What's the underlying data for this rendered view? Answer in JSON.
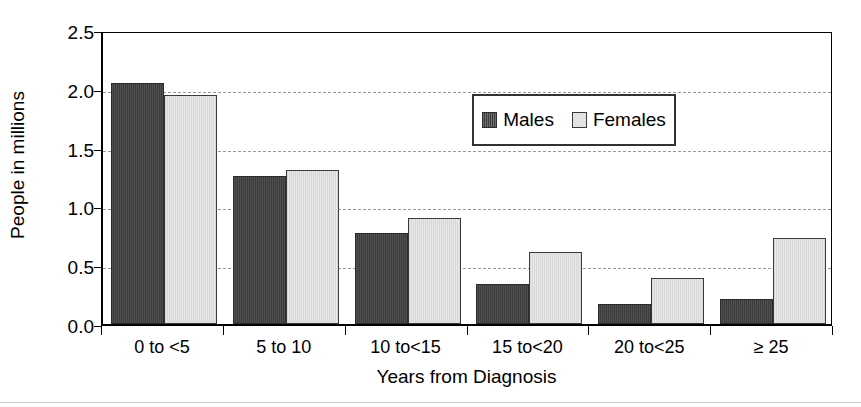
{
  "chart_data": {
    "type": "bar",
    "title": "",
    "xlabel": "Years from Diagnosis",
    "ylabel": "People in millions",
    "categories": [
      "0 to <5",
      "5 to 10",
      "10 to<15",
      "15 to<20",
      "20 to<25",
      "≥ 25"
    ],
    "series": [
      {
        "name": "Males",
        "values": [
          2.05,
          1.26,
          0.77,
          0.34,
          0.17,
          0.21
        ],
        "color": "#3c3c3c"
      },
      {
        "name": "Females",
        "values": [
          1.95,
          1.31,
          0.9,
          0.61,
          0.39,
          0.73
        ],
        "color": "#e8e8e8"
      }
    ],
    "ylim": [
      0.0,
      2.5
    ],
    "ytick_labels": [
      "0.0",
      "0.5",
      "1.0",
      "1.5",
      "2.0",
      "2.5"
    ],
    "ytick_values": [
      0.0,
      0.5,
      1.0,
      1.5,
      2.0,
      2.5
    ],
    "grid": true,
    "grid_axis": "y",
    "grid_style": "dashed",
    "grid_color": "#999999",
    "legend_position": "upper-center-inside",
    "legend_entries": [
      "Males",
      "Females"
    ],
    "axis_color": "#000000",
    "background": "#ffffff"
  }
}
